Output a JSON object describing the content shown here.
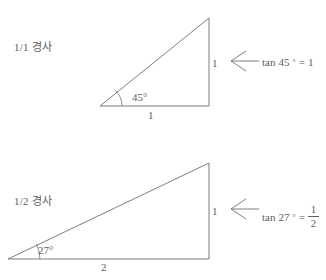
{
  "figure": {
    "title_present": false,
    "background_color": "#ffffff",
    "ink_color": "#5a5f63"
  },
  "panels": [
    {
      "id": "panel-1-1",
      "slope_label": "1/1 경사",
      "triangle": {
        "base_label": "1",
        "height_label": "1",
        "angle_label": "45°",
        "angle_value": 45,
        "base_value": 1,
        "height_value": 1,
        "vertices": {
          "left": [
            100,
            106
          ],
          "right": [
            209,
            106
          ],
          "apex": [
            209,
            18
          ]
        }
      },
      "arrow": {
        "icon": "long-left-arrow-icon",
        "direction": "left"
      },
      "equation": {
        "function": "tan",
        "angle": "45",
        "degree_symbol": "°",
        "equals": "=",
        "result_type": "integer",
        "result": "1"
      }
    },
    {
      "id": "panel-1-2",
      "slope_label": "1/2 경사",
      "triangle": {
        "base_label": "2",
        "height_label": "1",
        "angle_label": "27°",
        "angle_value": 27,
        "base_value": 2,
        "height_value": 1,
        "vertices": {
          "left": [
            8,
            259
          ],
          "right": [
            209,
            259
          ],
          "apex": [
            209,
            163
          ]
        }
      },
      "arrow": {
        "icon": "long-left-arrow-icon",
        "direction": "left"
      },
      "equation": {
        "function": "tan",
        "angle": "27",
        "degree_symbol": "°",
        "equals": "=",
        "result_type": "fraction",
        "result_numerator": "1",
        "result_denominator": "2"
      }
    }
  ]
}
